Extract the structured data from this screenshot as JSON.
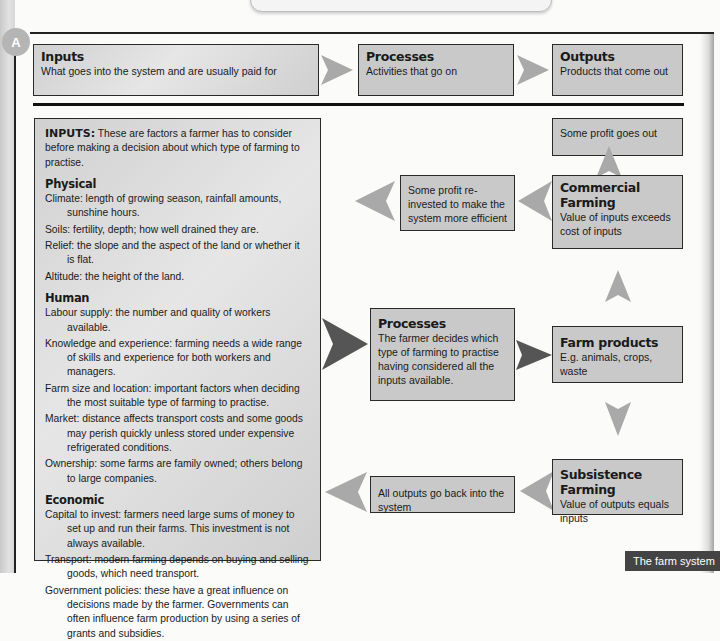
{
  "figure": {
    "badge": "A",
    "caption": "The farm system"
  },
  "top_row": {
    "inputs": {
      "title": "Inputs",
      "text": "What goes into the system and are usually paid for"
    },
    "processes": {
      "title": "Processes",
      "text": "Activities that go on"
    },
    "outputs": {
      "title": "Outputs",
      "text": "Products that come out"
    }
  },
  "inputs_panel": {
    "lead_bold": "INPUTS:",
    "lead_text": " These are factors a farmer has to consider before making a decision about which type of farming to practise.",
    "sections": [
      {
        "heading": "Physical",
        "items": [
          "Climate: length of growing season, rainfall amounts, sunshine hours.",
          "Soils: fertility, depth; how well drained they are.",
          "Relief: the slope and the aspect of the land or whether it is flat.",
          "Altitude: the height of the land."
        ]
      },
      {
        "heading": "Human",
        "items": [
          "Labour supply: the number and quality of workers available.",
          "Knowledge and experience: farming needs a wide range of skills and experience for both workers and managers.",
          "Farm size and location: important factors when deciding the most suitable type of farming to practise.",
          "Market: distance affects transport costs and some goods may perish quickly unless stored under expensive refrigerated conditions.",
          "Ownership: some farms are family owned; others belong to large companies."
        ]
      },
      {
        "heading": "Economic",
        "items": [
          "Capital to invest: farmers need large sums of money to set up and run their farms. This investment is not always available.",
          "Transport: modern farming depends on buying and selling goods, which need transport.",
          "Government policies: these have a great influence on decisions made by the farmer. Governments can often influence farm production by using a series of grants and subsidies."
        ]
      }
    ]
  },
  "flow": {
    "processes": {
      "title": "Processes",
      "text": "The farmer decides which type of farming to practise having considered all the inputs available."
    },
    "farm_products": {
      "title": "Farm products",
      "text": "E.g. animals, crops, waste"
    },
    "commercial": {
      "title": "Commercial Farming",
      "text": "Value of inputs exceeds cost of inputs"
    },
    "subsistence": {
      "title": "Subsistence Farming",
      "text": "Value of outputs equals inputs"
    },
    "profit_out": {
      "text": "Some profit goes out"
    },
    "profit_reinvested": {
      "text": "Some profit re-invested to make the system more efficient"
    },
    "outputs_back": {
      "text": "All outputs go back into the system"
    }
  },
  "colors": {
    "box_fill": "#c9c9c9",
    "border": "#2a2a2a",
    "arrow_light": "#a9a9a9",
    "arrow_dark": "#555555",
    "caption_bg": "#444444"
  }
}
